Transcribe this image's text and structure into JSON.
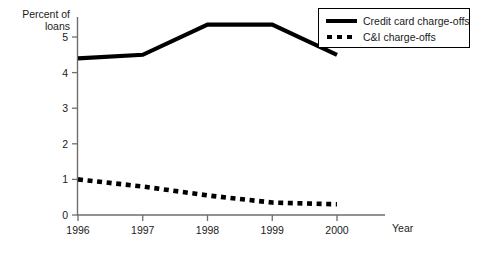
{
  "chart_data": {
    "type": "line",
    "title": "",
    "subtitle": "",
    "xlabel": "Year",
    "ylabel": "Percent of loans",
    "ylabel_lines": [
      "Percent of",
      "loans"
    ],
    "categories": [
      "1996",
      "1997",
      "1998",
      "1999",
      "2000"
    ],
    "x": [
      1996,
      1997,
      1998,
      1999,
      2000
    ],
    "xlim": [
      1996,
      2000
    ],
    "ylim": [
      0,
      5.5
    ],
    "yticks": [
      "0",
      "1",
      "2",
      "3",
      "4",
      "5"
    ],
    "ytick_values": [
      0,
      1,
      2,
      3,
      4,
      5
    ],
    "xticks": [
      "1996",
      "1997",
      "1998",
      "1999",
      "2000"
    ],
    "grid": false,
    "legend_position": "top-right",
    "series": [
      {
        "name": "Credit card charge-offs",
        "style": "solid",
        "color": "#000000",
        "values": [
          4.4,
          4.5,
          5.35,
          5.35,
          4.5
        ]
      },
      {
        "name": "C&I charge-offs",
        "style": "dotted",
        "color": "#000000",
        "values": [
          1.0,
          0.8,
          0.55,
          0.35,
          0.3
        ]
      }
    ]
  },
  "legend": {
    "entries": [
      {
        "label": "Credit card charge-offs",
        "swatch": "solid-line-swatch"
      },
      {
        "label": "C&I charge-offs",
        "swatch": "dotted-line-swatch"
      }
    ]
  },
  "axes": {
    "y_title_line1": "Percent of",
    "y_title_line2": "loans",
    "x_title": "Year"
  },
  "colors": {
    "line": "#000000",
    "axis": "#6e6e6e",
    "text": "#1a1a1a",
    "background": "#ffffff"
  }
}
